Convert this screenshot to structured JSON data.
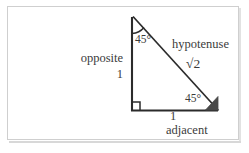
{
  "figure": {
    "type": "geometry-diagram",
    "shape": "right-triangle-45-45-90",
    "background_color": "#ffffff",
    "frame_border_color": "#cfcfcf",
    "stroke_color": "#2b2b2b",
    "text_color": "#3b3b3b",
    "labels": {
      "opposite": "opposite",
      "opposite_value": "1",
      "hypotenuse": "hypotenuse",
      "hypotenuse_value": "√2",
      "adjacent": "adjacent",
      "adjacent_value": "1",
      "angle_top": "45°",
      "angle_right": "45°"
    },
    "markers": {
      "right_angle": "right-angle-square",
      "top_angle": "angle-arc",
      "right_angle_45": "filled-angle-wedge"
    },
    "vertices": {
      "apex": [
        133,
        16
      ],
      "bottom_left": [
        131,
        111
      ],
      "bottom_right": [
        218,
        111
      ]
    }
  }
}
